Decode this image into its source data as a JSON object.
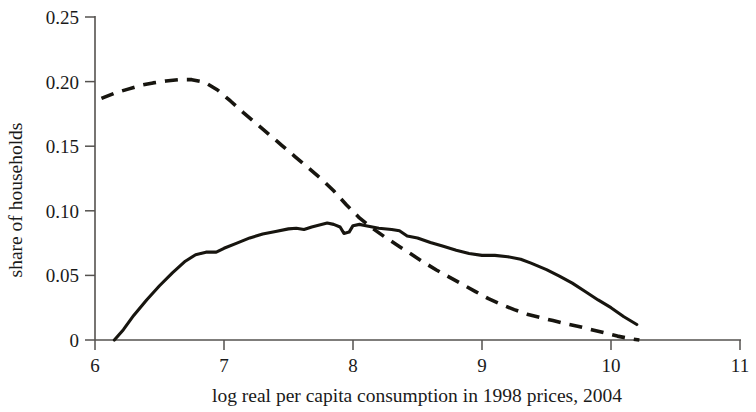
{
  "chart_data": {
    "type": "line",
    "title": "",
    "xlabel": "log real per capita consumption in 1998 prices, 2004",
    "ylabel": "share of households",
    "xlim": [
      6,
      11
    ],
    "ylim": [
      0,
      0.25
    ],
    "grid": false,
    "legend": "none",
    "xticks": [
      6,
      7,
      8,
      9,
      10,
      11
    ],
    "xtick_labels": [
      "6",
      "7",
      "8",
      "9",
      "10",
      "11"
    ],
    "yticks": [
      0,
      0.05,
      0.1,
      0.15,
      0.2,
      0.25
    ],
    "ytick_labels": [
      "0",
      "0.05",
      "0.10",
      "0.15",
      "0.20",
      "0.25"
    ],
    "series": [
      {
        "name": "solid-distribution",
        "style": "solid",
        "color": "#17150f",
        "points": [
          [
            6.15,
            0.0
          ],
          [
            6.22,
            0.008
          ],
          [
            6.3,
            0.019
          ],
          [
            6.4,
            0.031
          ],
          [
            6.5,
            0.042
          ],
          [
            6.6,
            0.052
          ],
          [
            6.7,
            0.061
          ],
          [
            6.78,
            0.066
          ],
          [
            6.86,
            0.068
          ],
          [
            6.94,
            0.068
          ],
          [
            7.0,
            0.071
          ],
          [
            7.1,
            0.075
          ],
          [
            7.2,
            0.079
          ],
          [
            7.3,
            0.082
          ],
          [
            7.4,
            0.084
          ],
          [
            7.5,
            0.086
          ],
          [
            7.56,
            0.0865
          ],
          [
            7.62,
            0.0855
          ],
          [
            7.68,
            0.0875
          ],
          [
            7.74,
            0.089
          ],
          [
            7.8,
            0.0905
          ],
          [
            7.85,
            0.0895
          ],
          [
            7.9,
            0.0875
          ],
          [
            7.93,
            0.0825
          ],
          [
            7.97,
            0.0835
          ],
          [
            8.0,
            0.0885
          ],
          [
            8.05,
            0.0895
          ],
          [
            8.1,
            0.0885
          ],
          [
            8.2,
            0.0865
          ],
          [
            8.3,
            0.0855
          ],
          [
            8.36,
            0.0845
          ],
          [
            8.42,
            0.0805
          ],
          [
            8.5,
            0.079
          ],
          [
            8.6,
            0.0755
          ],
          [
            8.7,
            0.0725
          ],
          [
            8.8,
            0.0695
          ],
          [
            8.9,
            0.067
          ],
          [
            9.0,
            0.0655
          ],
          [
            9.1,
            0.0655
          ],
          [
            9.2,
            0.0645
          ],
          [
            9.3,
            0.0625
          ],
          [
            9.38,
            0.0595
          ],
          [
            9.5,
            0.0545
          ],
          [
            9.6,
            0.0495
          ],
          [
            9.7,
            0.044
          ],
          [
            9.8,
            0.0375
          ],
          [
            9.9,
            0.031
          ],
          [
            10.0,
            0.025
          ],
          [
            10.1,
            0.018
          ],
          [
            10.2,
            0.012
          ]
        ]
      },
      {
        "name": "dashed-distribution",
        "style": "dashed",
        "color": "#17150f",
        "points": [
          [
            6.05,
            0.187
          ],
          [
            6.15,
            0.191
          ],
          [
            6.25,
            0.194
          ],
          [
            6.35,
            0.197
          ],
          [
            6.45,
            0.199
          ],
          [
            6.55,
            0.2005
          ],
          [
            6.65,
            0.2015
          ],
          [
            6.75,
            0.2015
          ],
          [
            6.85,
            0.1995
          ],
          [
            6.95,
            0.1935
          ],
          [
            7.05,
            0.185
          ],
          [
            7.15,
            0.176
          ],
          [
            7.25,
            0.1675
          ],
          [
            7.35,
            0.159
          ],
          [
            7.45,
            0.1505
          ],
          [
            7.55,
            0.142
          ],
          [
            7.65,
            0.1335
          ],
          [
            7.75,
            0.125
          ],
          [
            7.85,
            0.1155
          ],
          [
            7.95,
            0.1045
          ],
          [
            8.05,
            0.0945
          ],
          [
            8.15,
            0.0865
          ],
          [
            8.25,
            0.0795
          ],
          [
            8.35,
            0.073
          ],
          [
            8.45,
            0.0665
          ],
          [
            8.55,
            0.06
          ],
          [
            8.65,
            0.054
          ],
          [
            8.75,
            0.0485
          ],
          [
            8.85,
            0.043
          ],
          [
            8.95,
            0.0375
          ],
          [
            9.05,
            0.032
          ],
          [
            9.15,
            0.0275
          ],
          [
            9.25,
            0.0235
          ],
          [
            9.35,
            0.02
          ],
          [
            9.45,
            0.0175
          ],
          [
            9.55,
            0.015
          ],
          [
            9.65,
            0.0125
          ],
          [
            9.75,
            0.0105
          ],
          [
            9.85,
            0.008
          ],
          [
            9.95,
            0.0055
          ],
          [
            10.05,
            0.003
          ],
          [
            10.15,
            0.001
          ],
          [
            10.22,
            0.0
          ]
        ]
      }
    ]
  }
}
